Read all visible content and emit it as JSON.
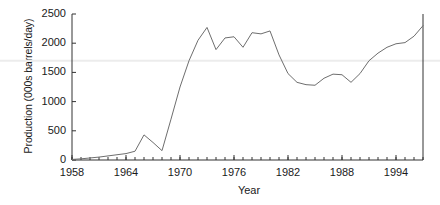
{
  "chart_data": {
    "type": "line",
    "title": "",
    "xlabel": "Year",
    "ylabel": "Production (000s barrels/day)",
    "xlim": [
      1958,
      1997
    ],
    "ylim": [
      0,
      2500
    ],
    "xticks": [
      1958,
      1964,
      1970,
      1976,
      1982,
      1988,
      1994
    ],
    "xtick_labels": [
      "1958",
      "1964",
      "1970",
      "1976",
      "1982",
      "1988",
      "1994"
    ],
    "minor_xtick_interval": 1,
    "yticks": [
      0,
      500,
      1000,
      1500,
      2000,
      2500
    ],
    "ytick_labels": [
      "0",
      "500",
      "1000",
      "1500",
      "2000",
      "2500"
    ],
    "grid": false,
    "legend": "none",
    "line_color": "#6e6e6e",
    "background_color": "#ffffff",
    "axis_color": "#333333",
    "x": [
      1958,
      1959,
      1960,
      1961,
      1962,
      1963,
      1964,
      1965,
      1966,
      1967,
      1968,
      1969,
      1970,
      1971,
      1972,
      1973,
      1974,
      1975,
      1976,
      1977,
      1978,
      1979,
      1980,
      1981,
      1982,
      1983,
      1984,
      1985,
      1986,
      1987,
      1988,
      1989,
      1990,
      1991,
      1992,
      1993,
      1994,
      1995,
      1996,
      1997
    ],
    "series": [
      {
        "name": "Production",
        "values": [
          10,
          20,
          35,
          50,
          70,
          90,
          110,
          150,
          430,
          300,
          160,
          700,
          1250,
          1700,
          2050,
          2270,
          1890,
          2090,
          2110,
          1930,
          2180,
          2160,
          2210,
          1800,
          1480,
          1330,
          1290,
          1280,
          1400,
          1470,
          1460,
          1330,
          1480,
          1700,
          1830,
          1930,
          1990,
          2010,
          2120,
          2300
        ]
      }
    ]
  }
}
